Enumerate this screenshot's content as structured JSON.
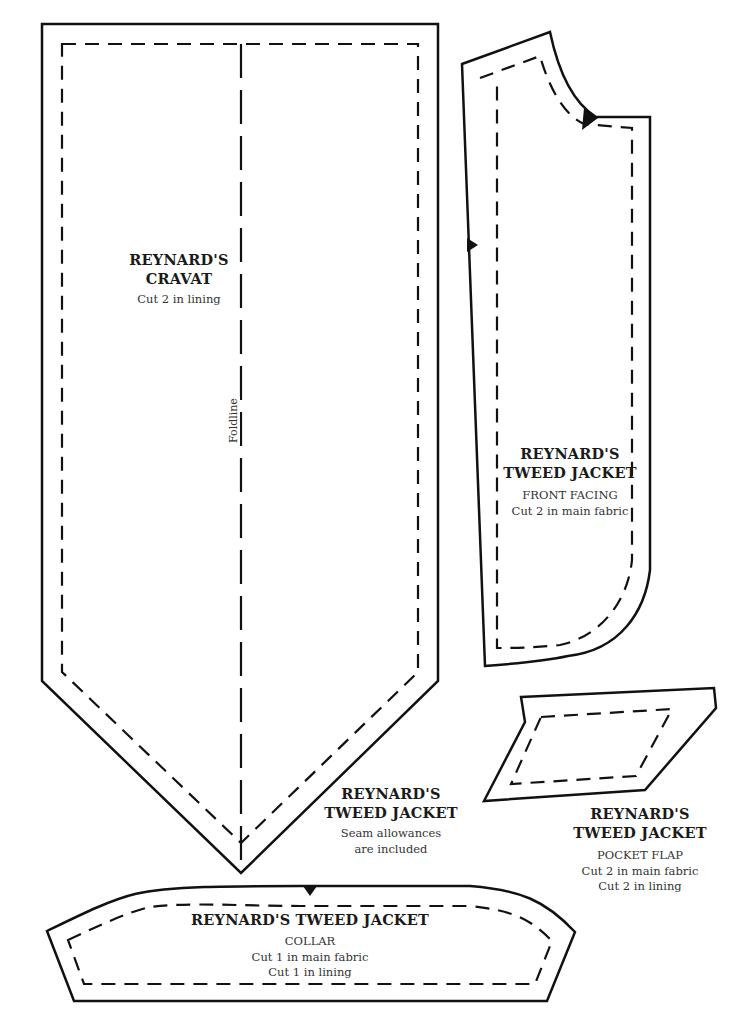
{
  "pieces": {
    "cravat": {
      "title_line1": "REYNARD'S",
      "title_line2": "CRAVAT",
      "note": "Cut 2 in lining",
      "fold_label": "Foldline"
    },
    "front_facing": {
      "title_line1": "REYNARD'S",
      "title_line2": "TWEED JACKET",
      "part": "FRONT FACING",
      "cut1": "Cut 2 in main fabric"
    },
    "seam_note": {
      "title_line1": "REYNARD'S",
      "title_line2": "TWEED JACKET",
      "note_line1": "Seam allowances",
      "note_line2": "are included"
    },
    "pocket_flap": {
      "title_line1": "REYNARD'S",
      "title_line2": "TWEED JACKET",
      "part": "POCKET FLAP",
      "cut1": "Cut 2 in main fabric",
      "cut2": "Cut 2 in lining"
    },
    "collar": {
      "title": "REYNARD'S TWEED JACKET",
      "part": "COLLAR",
      "cut1": "Cut 1 in main fabric",
      "cut2": "Cut 1 in lining"
    }
  },
  "colors": {
    "line": "#111111",
    "background": "#ffffff"
  }
}
